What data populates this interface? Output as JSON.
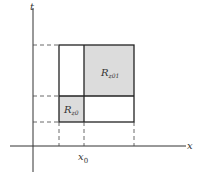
{
  "diagram": {
    "axes": {
      "x_label": "x",
      "y_label": "t"
    },
    "tick_label": {
      "main": "x",
      "sub": "0"
    },
    "regions": [
      {
        "id": "R_z0",
        "main": "R",
        "sub": "z0",
        "fill": "#dcdcdc"
      },
      {
        "id": "R_z01",
        "main": "R",
        "sub": "z01",
        "fill": "#dcdcdc"
      }
    ],
    "colors": {
      "line": "#222222",
      "dash": "#444444",
      "shade": "#dcdcdc"
    }
  }
}
